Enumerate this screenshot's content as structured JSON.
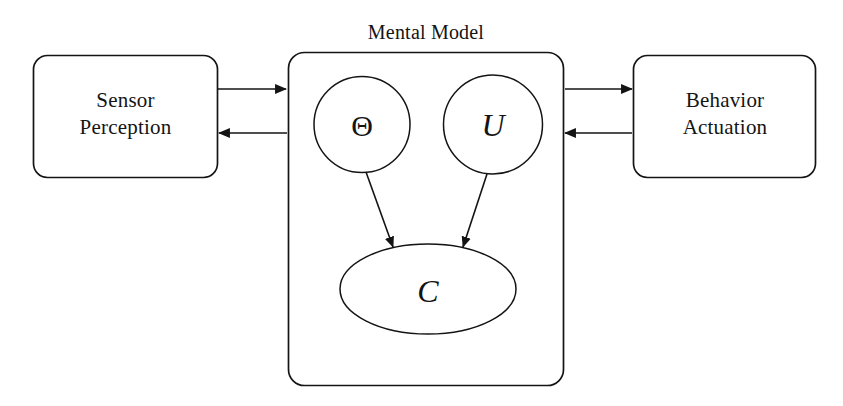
{
  "figure": {
    "background_color": "#ffffff",
    "stroke_color": "#141414",
    "container": {
      "title": "Mental Model"
    },
    "blocks": [
      {
        "id": "sensor-perception",
        "line1": "Sensor",
        "line2": "Perception"
      },
      {
        "id": "behavior-actuation",
        "line1": "Behavior",
        "line2": "Actuation"
      }
    ],
    "nodes": [
      {
        "id": "theta",
        "label": "Θ",
        "shape": "circle"
      },
      {
        "id": "u",
        "label": "U",
        "shape": "circle"
      },
      {
        "id": "c",
        "label": "C",
        "shape": "ellipse"
      }
    ],
    "edges": [
      {
        "id": "perception-to-model",
        "from": "sensor-perception",
        "to": "mental-model",
        "direction": "right"
      },
      {
        "id": "model-to-perception",
        "from": "mental-model",
        "to": "sensor-perception",
        "direction": "left"
      },
      {
        "id": "model-to-actuation",
        "from": "mental-model",
        "to": "behavior-actuation",
        "direction": "right"
      },
      {
        "id": "actuation-to-model",
        "from": "behavior-actuation",
        "to": "mental-model",
        "direction": "left"
      },
      {
        "id": "theta-to-c",
        "from": "theta",
        "to": "c",
        "direction": "down-right"
      },
      {
        "id": "u-to-c",
        "from": "u",
        "to": "c",
        "direction": "down-left"
      }
    ]
  }
}
